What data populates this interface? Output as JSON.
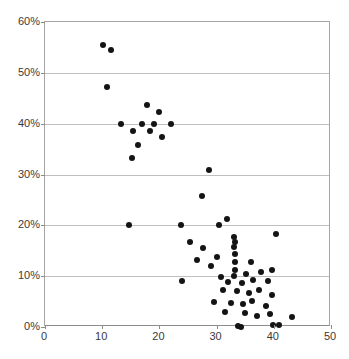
{
  "chart_data": {
    "type": "scatter",
    "title": "",
    "xlabel": "",
    "ylabel": "",
    "xlim": [
      0,
      50
    ],
    "ylim": [
      0,
      0.6
    ],
    "grid": true,
    "legend": false,
    "legend_position": "none",
    "marker_color": "#141414",
    "marker_shape": "circle",
    "xticks": [
      0,
      10,
      20,
      30,
      40,
      50
    ],
    "xtick_labels": [
      "0",
      "10",
      "20",
      "30",
      "40",
      "50"
    ],
    "yticks": [
      0,
      0.1,
      0.2,
      0.3,
      0.4,
      0.5,
      0.6
    ],
    "ytick_labels": [
      "0%",
      "10%",
      "20%",
      "30%",
      "40%",
      "50%",
      "60%"
    ],
    "points": [
      {
        "x": 10.2,
        "y": 0.555
      },
      {
        "x": 11.6,
        "y": 0.545
      },
      {
        "x": 10.8,
        "y": 0.472
      },
      {
        "x": 17.8,
        "y": 0.437
      },
      {
        "x": 20.0,
        "y": 0.423
      },
      {
        "x": 13.2,
        "y": 0.4
      },
      {
        "x": 17.0,
        "y": 0.4
      },
      {
        "x": 19.0,
        "y": 0.4
      },
      {
        "x": 22.0,
        "y": 0.4
      },
      {
        "x": 15.4,
        "y": 0.386
      },
      {
        "x": 18.3,
        "y": 0.385
      },
      {
        "x": 20.4,
        "y": 0.373
      },
      {
        "x": 16.2,
        "y": 0.358
      },
      {
        "x": 15.2,
        "y": 0.333
      },
      {
        "x": 28.6,
        "y": 0.308
      },
      {
        "x": 27.5,
        "y": 0.258
      },
      {
        "x": 14.6,
        "y": 0.2
      },
      {
        "x": 23.7,
        "y": 0.2
      },
      {
        "x": 31.8,
        "y": 0.212
      },
      {
        "x": 30.4,
        "y": 0.2
      },
      {
        "x": 25.4,
        "y": 0.167
      },
      {
        "x": 27.6,
        "y": 0.155
      },
      {
        "x": 33.0,
        "y": 0.178
      },
      {
        "x": 33.3,
        "y": 0.168
      },
      {
        "x": 33.0,
        "y": 0.157
      },
      {
        "x": 40.3,
        "y": 0.182
      },
      {
        "x": 26.6,
        "y": 0.131
      },
      {
        "x": 30.0,
        "y": 0.138
      },
      {
        "x": 33.2,
        "y": 0.143
      },
      {
        "x": 33.2,
        "y": 0.128
      },
      {
        "x": 36.1,
        "y": 0.128
      },
      {
        "x": 24.0,
        "y": 0.09
      },
      {
        "x": 29.1,
        "y": 0.12
      },
      {
        "x": 33.2,
        "y": 0.112
      },
      {
        "x": 33.1,
        "y": 0.1
      },
      {
        "x": 35.2,
        "y": 0.104
      },
      {
        "x": 37.8,
        "y": 0.108
      },
      {
        "x": 39.7,
        "y": 0.112
      },
      {
        "x": 30.8,
        "y": 0.099
      },
      {
        "x": 32.0,
        "y": 0.088
      },
      {
        "x": 34.4,
        "y": 0.086
      },
      {
        "x": 36.4,
        "y": 0.092
      },
      {
        "x": 38.9,
        "y": 0.09
      },
      {
        "x": 31.2,
        "y": 0.073
      },
      {
        "x": 33.6,
        "y": 0.07
      },
      {
        "x": 35.6,
        "y": 0.066
      },
      {
        "x": 37.4,
        "y": 0.073
      },
      {
        "x": 39.6,
        "y": 0.062
      },
      {
        "x": 29.6,
        "y": 0.05
      },
      {
        "x": 32.6,
        "y": 0.048
      },
      {
        "x": 34.6,
        "y": 0.046
      },
      {
        "x": 36.2,
        "y": 0.052
      },
      {
        "x": 38.6,
        "y": 0.042
      },
      {
        "x": 31.4,
        "y": 0.03
      },
      {
        "x": 35.0,
        "y": 0.028
      },
      {
        "x": 37.0,
        "y": 0.022
      },
      {
        "x": 39.4,
        "y": 0.026
      },
      {
        "x": 33.8,
        "y": 0.002
      },
      {
        "x": 39.9,
        "y": 0.004
      },
      {
        "x": 40.9,
        "y": 0.004
      },
      {
        "x": 34.3,
        "y": 0.0
      },
      {
        "x": 43.2,
        "y": 0.02
      }
    ]
  }
}
